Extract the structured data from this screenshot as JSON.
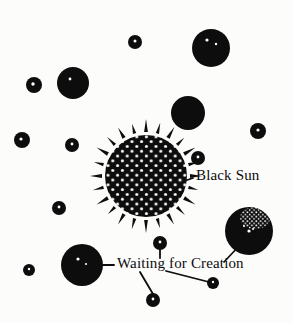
{
  "illustration": {
    "title": "Black Sun and Waiting for Creation",
    "background_color": "#fcfcfb",
    "ink_color": "#0d0d0d",
    "speckle_color": "#ffffff",
    "labels": {
      "black_sun": "Black Sun",
      "waiting_for_creation": "Waiting for Creation"
    },
    "bodies": [
      {
        "name": "black-sun",
        "kind": "rayed-speckled-disc",
        "cx": 146,
        "cy": 176,
        "r": 41,
        "rays": 24
      },
      {
        "name": "planet-top-right",
        "kind": "disc",
        "cx": 211,
        "cy": 48,
        "r": 19
      },
      {
        "name": "planet-upper-left",
        "kind": "disc",
        "cx": 73,
        "cy": 83,
        "r": 16
      },
      {
        "name": "planet-mid-right",
        "kind": "disc",
        "cx": 188,
        "cy": 113,
        "r": 17
      },
      {
        "name": "planet-highlight-right",
        "kind": "disc-with-speckled-patch",
        "cx": 249,
        "cy": 231,
        "r": 24
      },
      {
        "name": "planet-lower-left",
        "kind": "disc",
        "cx": 82,
        "cy": 265,
        "r": 21
      },
      {
        "name": "star-top-center",
        "kind": "dot",
        "cx": 135,
        "cy": 42,
        "r": 7
      },
      {
        "name": "star-left-upper",
        "kind": "dot",
        "cx": 34,
        "cy": 85,
        "r": 8
      },
      {
        "name": "star-left-mid",
        "kind": "dot",
        "cx": 22,
        "cy": 140,
        "r": 8
      },
      {
        "name": "star-left-inner",
        "kind": "dot",
        "cx": 72,
        "cy": 145,
        "r": 7
      },
      {
        "name": "star-left-lower",
        "kind": "dot",
        "cx": 59,
        "cy": 208,
        "r": 7
      },
      {
        "name": "star-far-left-bottom",
        "kind": "dot",
        "cx": 29,
        "cy": 270,
        "r": 6
      },
      {
        "name": "star-right-of-sun",
        "kind": "dot",
        "cx": 198,
        "cy": 158,
        "r": 7
      },
      {
        "name": "star-far-right",
        "kind": "dot",
        "cx": 258,
        "cy": 131,
        "r": 8
      },
      {
        "name": "star-above-label",
        "kind": "dot",
        "cx": 160,
        "cy": 243,
        "r": 7
      },
      {
        "name": "star-bottom-center",
        "kind": "dot",
        "cx": 153,
        "cy": 300,
        "r": 7
      },
      {
        "name": "star-bottom-right",
        "kind": "dot",
        "cx": 213,
        "cy": 283,
        "r": 6
      }
    ],
    "leader_lines": [
      {
        "name": "leader-black-sun",
        "x1": 176,
        "y1": 184,
        "x2": 192,
        "y2": 178
      },
      {
        "name": "leader-waiting-to-left-planet",
        "x1": 113,
        "y1": 265,
        "x2": 100,
        "y2": 265
      },
      {
        "name": "leader-waiting-to-star-above",
        "x1": 160,
        "y1": 252,
        "x2": 160,
        "y2": 261
      },
      {
        "name": "leader-waiting-to-star-bottom",
        "x1": 141,
        "y1": 273,
        "x2": 153,
        "y2": 295
      },
      {
        "name": "leader-waiting-to-star-bottom-right",
        "x1": 168,
        "y1": 272,
        "x2": 209,
        "y2": 282
      },
      {
        "name": "leader-waiting-to-right-planet",
        "x1": 223,
        "y1": 261,
        "x2": 238,
        "y2": 247
      }
    ]
  }
}
